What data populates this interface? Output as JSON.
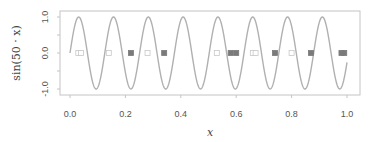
{
  "chart_data": {
    "type": "line",
    "title": "",
    "xlabel": "x",
    "ylabel": "sin(50 · x)",
    "xlim": [
      0.0,
      1.0
    ],
    "ylim": [
      -1.0,
      1.0
    ],
    "x_ticks": [
      "0.0",
      "0.2",
      "0.4",
      "0.6",
      "0.8",
      "1.0"
    ],
    "y_ticks": [
      "1.0",
      "0.0",
      "-1.0"
    ],
    "grid": false,
    "legend": null,
    "series": [
      {
        "name": "sin(50x)",
        "kind": "line",
        "function": "sin(50*x)",
        "x_range": [
          0.0,
          1.0
        ],
        "color": "#b0b0b0"
      },
      {
        "name": "open-squares",
        "kind": "scatter",
        "marker": "open-square",
        "color": "#c8c8c8",
        "x": [
          0.03,
          0.04,
          0.14,
          0.28,
          0.53,
          0.66,
          0.67,
          0.8
        ],
        "y": [
          0,
          0,
          0,
          0,
          0,
          0,
          0,
          0
        ]
      },
      {
        "name": "filled-squares",
        "kind": "scatter",
        "marker": "filled-square",
        "color": "#7a7a7a",
        "x": [
          0.22,
          0.34,
          0.58,
          0.6,
          0.74,
          0.87,
          0.98,
          0.99
        ],
        "y": [
          0,
          0,
          0,
          0,
          0,
          0,
          0,
          0
        ]
      }
    ]
  },
  "axes": {
    "x_label": "x",
    "y_label": "sin(50 · x)",
    "x_ticks": [
      "0.0",
      "0.2",
      "0.4",
      "0.6",
      "0.8",
      "1.0"
    ],
    "y_ticks": [
      "1.0",
      "0.0",
      "-1.0"
    ]
  },
  "colors": {
    "curve": "#b0b0b0",
    "frame": "#c0c0c0",
    "open_marker": "#c8c8c8",
    "filled_marker": "#7a7a7a"
  }
}
